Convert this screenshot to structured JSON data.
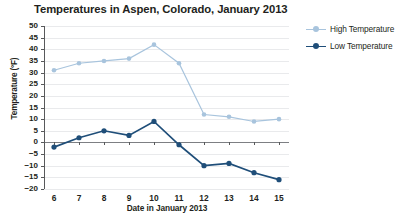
{
  "chart_data": {
    "type": "line",
    "title": "Temperatures in Aspen, Colorado, January 2013",
    "xlabel": "Date in January 2013",
    "ylabel": "Temperature (°F)",
    "x": [
      6,
      7,
      8,
      9,
      10,
      11,
      12,
      13,
      14,
      15
    ],
    "xtick_labels": [
      "6",
      "7",
      "8",
      "9",
      "10",
      "11",
      "12",
      "13",
      "14",
      "15"
    ],
    "ytick_labels": [
      "50",
      "45",
      "40",
      "35",
      "30",
      "25",
      "20",
      "15",
      "10",
      "5",
      "0",
      "−5",
      "−10",
      "−15",
      "−20"
    ],
    "ylim": [
      -20,
      50
    ],
    "ytick_step": 5,
    "grid": true,
    "legend_position": "right",
    "series": [
      {
        "name": "High Temperature",
        "color": "#a8c4dd",
        "values": [
          31,
          34,
          35,
          36,
          42,
          34,
          12,
          11,
          9,
          10
        ]
      },
      {
        "name": "Low Temperature",
        "color": "#1f4e79",
        "values": [
          -2,
          2,
          5,
          3,
          9,
          -1,
          -10,
          -9,
          -13,
          -16
        ]
      }
    ]
  },
  "legend": {
    "items": [
      {
        "label": "High Temperature"
      },
      {
        "label": "Low Temperature"
      }
    ]
  },
  "colors": {
    "high": "#a8c4dd",
    "low": "#1f4e79",
    "grid": "#e9eaec",
    "axis": "#58595b",
    "zero": "#7d7f83",
    "text": "#231f20",
    "background": "#ffffff"
  }
}
